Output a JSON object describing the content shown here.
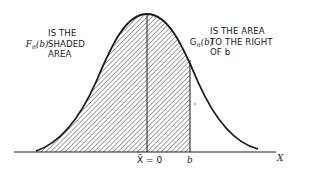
{
  "figure": {
    "type": "normal-distribution-tail-area",
    "colors": {
      "ink": "#1a1a1a",
      "background": "#ffffff"
    }
  },
  "labels": {
    "left_symbol": {
      "main": "F",
      "sub": "n",
      "arg": "(b)"
    },
    "left_text": "IS THE\nSHADED\nAREA",
    "right_symbol": {
      "main": "G",
      "sub": "n",
      "arg": "(b)"
    },
    "right_text": "IS THE AREA\nTO THE RIGHT\nOF b"
  },
  "axis": {
    "mean_label": "X̄ = 0",
    "b_label": "b",
    "x_label": "X"
  }
}
